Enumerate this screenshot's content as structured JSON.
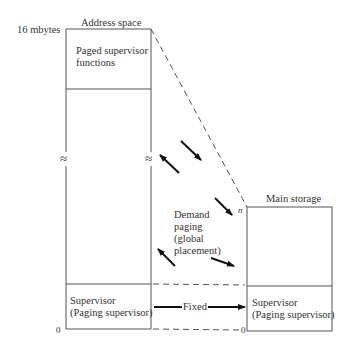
{
  "diagram": {
    "address_space": {
      "title": "Address space",
      "top_label": "16 mbytes",
      "bottom_label": "0",
      "paged_region_label_line1": "Paged supervisor",
      "paged_region_label_line2": "functions",
      "supervisor_label_line1": "Supervisor",
      "supervisor_label_line2": "(Paging supervisor)",
      "break_symbol": "≈"
    },
    "main_storage": {
      "title": "Main storage",
      "top_label": "n",
      "bottom_label": "0",
      "supervisor_label_line1": "Supervisor",
      "supervisor_label_line2": "(Paging supervisor)"
    },
    "demand_paging_label_line1": "Demand",
    "demand_paging_label_line2": "paging",
    "demand_paging_label_line3": "(global",
    "demand_paging_label_line4": "placement)",
    "fixed_label": "Fixed",
    "colors": {
      "line": "#444444",
      "arrow": "#111111",
      "background": "#ffffff"
    }
  }
}
